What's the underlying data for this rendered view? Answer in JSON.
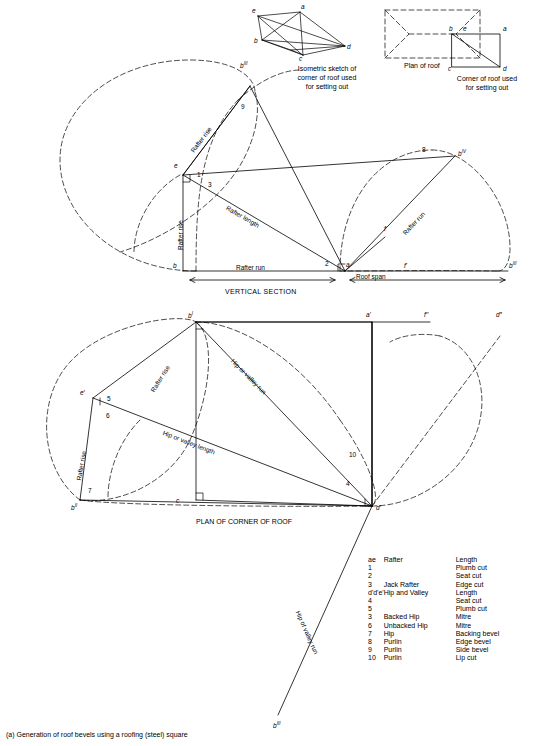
{
  "figure": {
    "caption": "(a) Generation of roof bevels using a roofing (steel) square",
    "titles": {
      "isometric": "Isometric sketch of\ncorner of roof used\nfor setting out",
      "isometric_l1": "Isometric sketch of",
      "isometric_l2": "corner of roof used",
      "isometric_l3": "for setting out",
      "plan_of_roof": "Plan of roof",
      "corner_l1": "Corner of roof used",
      "corner_l2": "for setting out",
      "vertical_section": "VERTICAL SECTION",
      "plan_of_corner": "PLAN OF CORNER OF ROOF"
    },
    "top_labels": {
      "iso_e": "e",
      "iso_a": "a",
      "iso_b": "b",
      "iso_c": "c",
      "iso_d": "d",
      "corner_b": "b",
      "corner_e": "e",
      "corner_a": "a",
      "corner_c": "c",
      "corner_d": "d"
    },
    "upper_labels": {
      "b3": "b",
      "b3sup": "III",
      "nine": "9",
      "e": "e",
      "one": "1",
      "three": "3",
      "eight": "8",
      "b4": "b",
      "b4sup": "IV",
      "rafter_rise_left": "Rafter rise",
      "rafter_rise_vert": "Rafter rise",
      "rafter_length": "Rafter length",
      "rafter_run_right": "Rafter run",
      "rafter_run_bottom": "Rafter run",
      "roof_span": "Roof span",
      "two": "2",
      "a": "a",
      "b": "b",
      "f": "f",
      "fprime": "f'",
      "b3b": "b",
      "b3bsup": "III"
    },
    "lower_labels": {
      "b1": "b",
      "b1sup": "I",
      "aprime": "a'",
      "fprime2": "f′′",
      "dprime2": "d″",
      "eprime": "e′",
      "five": "5",
      "six": "6",
      "seven": "7",
      "b2": "b",
      "b2sup": "II",
      "ten": "10",
      "four": "4",
      "c": "c",
      "dprime": "d′",
      "b3c": "b",
      "b3csup": "III",
      "rafter_rise_1": "Rafter rise",
      "rafter_rise_2": "Rafter rise",
      "hip_or_valley_run": "Hip or valley run",
      "hip_or_valley_length": "Hip or valley length",
      "hip_of_valley_run_bottom": "Hip of valley run"
    },
    "legend": [
      {
        "num": "ae",
        "name": "Rafter",
        "value": "Length"
      },
      {
        "num": "1",
        "name": "",
        "value": "Plumb cut"
      },
      {
        "num": "2",
        "name": "",
        "value": "Seat cut"
      },
      {
        "num": "3",
        "name": "Jack Rafter",
        "value": "Edge cut"
      },
      {
        "num": "d'd'e'",
        "name": "Hip and Valley",
        "value": "Length"
      },
      {
        "num": "4",
        "name": "",
        "value": "Seat cut"
      },
      {
        "num": "5",
        "name": "",
        "value": "Plumb cut"
      },
      {
        "num": "3",
        "name": "Backed Hip",
        "value": "Mitre"
      },
      {
        "num": "6",
        "name": "Unbacked Hip",
        "value": "Mitre"
      },
      {
        "num": "7",
        "name": "Hip",
        "value": "Backing bevel"
      },
      {
        "num": "8",
        "name": "Purlin",
        "value": "Edge bevel"
      },
      {
        "num": "9",
        "name": "Purlin",
        "value": "Side bevel"
      },
      {
        "num": "10",
        "name": "Purlin",
        "value": "Lip cut"
      }
    ]
  }
}
